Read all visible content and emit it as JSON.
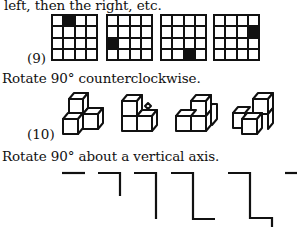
{
  "problem9": {
    "intro_text": "left, then the right, etc.",
    "label": "(9)",
    "grids": [
      {
        "filled": [
          0,
          1
        ]
      },
      {
        "filled": [
          2,
          0
        ]
      },
      {
        "filled": [
          3,
          2
        ]
      },
      {
        "filled": [
          1,
          3
        ]
      }
    ]
  },
  "problem10": {
    "instruction": "Rotate 90° counterclockwise.",
    "label": "(10)",
    "figures": [
      "cube-stack-1",
      "cube-stack-2",
      "cube-stack-3",
      "cube-stack-4"
    ]
  },
  "problem11": {
    "instruction": "Rotate 90° about a vertical axis.",
    "figures": [
      "line-1",
      "line-2",
      "line-3",
      "line-4",
      "line-5",
      "line-6"
    ]
  },
  "colors": {
    "ink": "#111111",
    "background": "#ffffff"
  }
}
